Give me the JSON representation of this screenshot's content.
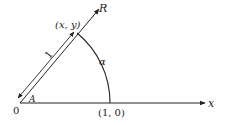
{
  "diagram": {
    "labels": {
      "ray": "R",
      "x_axis": "x",
      "point": "(x, y)",
      "unit_point": "(1, 0)",
      "origin": "0",
      "angle": "A",
      "arc": "α",
      "length": "1"
    },
    "colors": {
      "line": "#222222",
      "background": "#ffffff"
    }
  }
}
